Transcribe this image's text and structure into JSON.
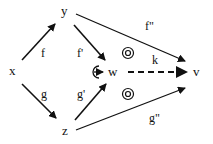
{
  "diagram": {
    "nodes": {
      "x": "x",
      "y": "y",
      "z": "z",
      "w": "w",
      "v": "v"
    },
    "edges": {
      "f": "f",
      "g": "g",
      "f_prime": "f'",
      "g_prime": "g'",
      "f_double_prime": "f\"",
      "g_double_prime": "g\"",
      "k": "k"
    },
    "colors": {
      "ink": "#111111",
      "background": "#ffffff"
    }
  }
}
